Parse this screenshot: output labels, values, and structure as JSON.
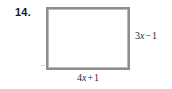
{
  "problem": {
    "number_label": "14.",
    "figure_type": "rectangle"
  },
  "figure": {
    "shape_name": "rectangle",
    "height_label": {
      "full_text": "3x − 1",
      "coefficient": "3",
      "variable": "x",
      "operator": "−",
      "constant": "1"
    },
    "width_label": {
      "full_text": "4x + 1",
      "coefficient": "4",
      "variable": "x",
      "operator": "+",
      "constant": "1"
    }
  },
  "colors": {
    "background": "#ffffff",
    "border": "#8e8e8e",
    "text": "#2b2b2b",
    "number_text": "#1a1a1a"
  }
}
